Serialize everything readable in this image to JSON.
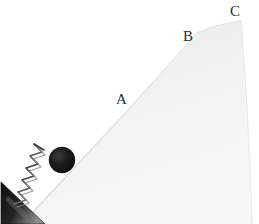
{
  "figure": {
    "name": "spring-launched-ball-on-incline",
    "kind": "physics-diagram",
    "width": 259,
    "height": 224,
    "background_color": "#ffffff"
  },
  "labels": {
    "a": "A",
    "b": "B",
    "c": "C"
  },
  "label_positions": {
    "a": {
      "x": 116,
      "y": 92
    },
    "b": {
      "x": 183,
      "y": 29
    },
    "c": {
      "x": 230,
      "y": 4
    }
  },
  "colors": {
    "incline_edge": "#e2e2e2",
    "incline_fill_top": "#eeeeee",
    "incline_fill_bottom": "#f6f6f6",
    "wedge_dark": "#1d1d1d",
    "wedge_light": "#9a9a9a",
    "ball_core": "#141414",
    "ball_edge": "#3a3a3a",
    "spring_wire": "#4a4a4a",
    "label_text": "#2b2b2b"
  },
  "incline": {
    "description": "straight ramp rising left-to-right, slope breaks at B, apex at C, short drop on right",
    "base_left": {
      "x": 22,
      "y": 224
    },
    "point_a": {
      "x": 130,
      "y": 108
    },
    "point_b": {
      "x": 197,
      "y": 33
    },
    "point_c": {
      "x": 241,
      "y": 21
    },
    "right_foot": {
      "x": 252,
      "y": 224
    }
  },
  "ball": {
    "center_x": 62,
    "center_y": 160,
    "radius": 13,
    "fill": "#141414"
  },
  "spring": {
    "coil_count": 9,
    "anchor": {
      "x": 18,
      "y": 206
    },
    "free_end": {
      "x": 52,
      "y": 170
    },
    "amplitude": 11,
    "wire_color": "#4a4a4a"
  },
  "wedge": {
    "description": "dark triangular block anchoring the spring at the bottom-left corner",
    "vertices": [
      {
        "x": 0,
        "y": 182
      },
      {
        "x": 44,
        "y": 224
      },
      {
        "x": 0,
        "y": 224
      }
    ]
  }
}
